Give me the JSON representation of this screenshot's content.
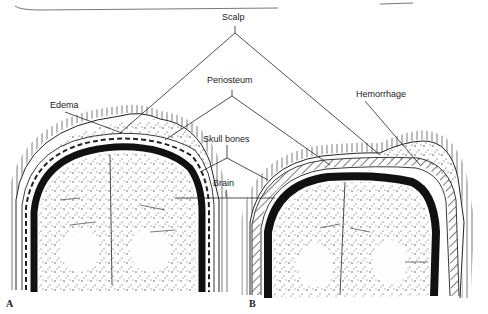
{
  "figure": {
    "labels": {
      "scalp": "Scalp",
      "periosteum": "Periosteum",
      "skull_bones": "Skull bones",
      "brain": "Brain",
      "edema": "Edema",
      "hemorrhage": "Hemorrhage"
    },
    "panels": {
      "a": "A",
      "b": "B"
    },
    "colors": {
      "ink": "#1a1a1a",
      "paper": "#ffffff"
    }
  }
}
